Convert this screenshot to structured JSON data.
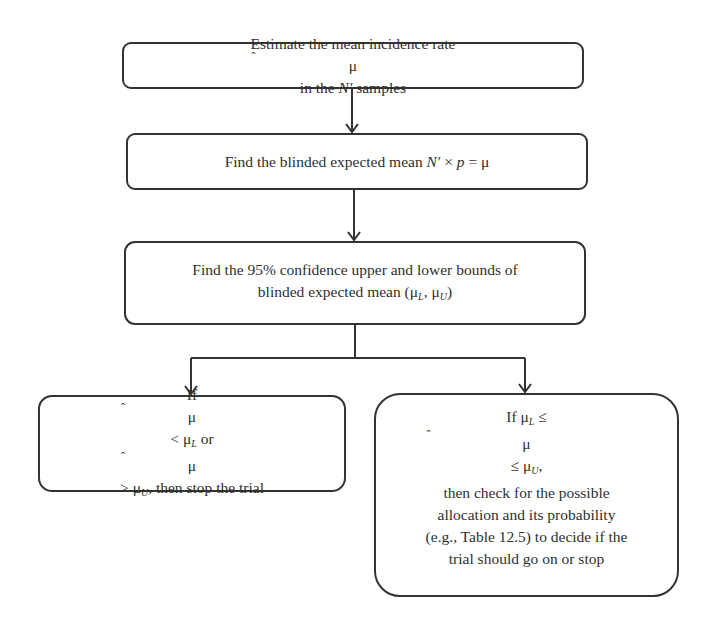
{
  "diagram": {
    "type": "flowchart",
    "nodes": [
      {
        "id": "step1",
        "text": "Estimate the mean incidence rate μ̂ in the N′ samples"
      },
      {
        "id": "step2",
        "text": "Find the blinded expected mean N′ × p = μ"
      },
      {
        "id": "step3",
        "lines": [
          "Find the 95% confidence upper and lower bounds of",
          "blinded expected mean (μL, μU)"
        ]
      },
      {
        "id": "stop",
        "text": "If μ̂ < μL or μ̂ > μU, then stop the trial"
      },
      {
        "id": "check",
        "lines": [
          "If μL ≤ μ̂ ≤ μU,",
          "then check for the possible",
          "allocation and its probability",
          "(e.g., Table 12.5) to decide if the",
          "trial should go on or stop"
        ]
      }
    ],
    "edges": [
      {
        "from": "step1",
        "to": "step2"
      },
      {
        "from": "step2",
        "to": "step3"
      },
      {
        "from": "step3",
        "to": "stop"
      },
      {
        "from": "step3",
        "to": "check"
      }
    ]
  },
  "text": {
    "s1_a": "Estimate the mean incidence rate ",
    "s1_mu": "μ",
    "s1_b": " in the ",
    "s1_N": "N′",
    "s1_c": " samples",
    "s2_a": "Find the blinded expected mean ",
    "s2_N": "N′",
    "s2_x": " × ",
    "s2_p": "p",
    "s2_eq": " = μ",
    "s3_l1": "Find the 95% confidence upper and lower bounds of",
    "s3_l2a": "blinded expected mean (μ",
    "s3_L": "L",
    "s3_comma": ", μ",
    "s3_U": "U",
    "s3_close": ")",
    "stop_if": "If ",
    "stop_mu1": "μ",
    "stop_lt": " < μ",
    "stop_L": "L",
    "stop_or": " or ",
    "stop_mu2": "μ",
    "stop_gt": " > μ",
    "stop_U": "U",
    "stop_tail": ", then stop the trial",
    "chk_if": "If μ",
    "chk_L": "L",
    "chk_le1": " ≤ ",
    "chk_mu": "μ",
    "chk_le2": " ≤ μ",
    "chk_U": "U",
    "chk_comma": ",",
    "chk_l2": "then check for the possible",
    "chk_l3": "allocation and its probability",
    "chk_l4": "(e.g., Table 12.5) to decide if the",
    "chk_l5": "trial should go on or stop"
  }
}
